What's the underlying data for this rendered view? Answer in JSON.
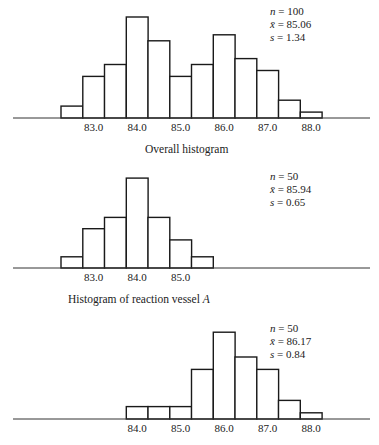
{
  "chart_data": [
    {
      "type": "bar",
      "title": "Overall histogram",
      "xlabel": "",
      "ylabel": "",
      "bin_width": 0.5,
      "bin_starts": [
        82.25,
        82.75,
        83.25,
        83.75,
        84.25,
        84.75,
        85.25,
        85.75,
        86.25,
        86.75,
        87.25,
        87.75
      ],
      "bin_centers": [
        82.5,
        83.0,
        83.5,
        84.0,
        84.5,
        85.0,
        85.5,
        86.0,
        86.5,
        87.0,
        87.5,
        88.0
      ],
      "values": [
        2,
        7,
        9,
        17,
        13,
        7,
        9,
        14,
        10,
        8,
        3,
        1
      ],
      "tick_labels": [
        "83.0",
        "84.0",
        "85.0",
        "86.0",
        "87.0",
        "88.0"
      ],
      "tick_values": [
        83.0,
        84.0,
        85.0,
        86.0,
        87.0,
        88.0
      ],
      "stats": {
        "n": "100",
        "mean": "85.06",
        "s": "1.34"
      },
      "grid": false
    },
    {
      "type": "bar",
      "title": "Histogram of reaction vessel A",
      "xlabel": "",
      "ylabel": "",
      "bin_width": 0.5,
      "bin_starts": [
        82.25,
        82.75,
        83.25,
        83.75,
        84.25,
        84.75,
        85.25
      ],
      "bin_centers": [
        82.5,
        83.0,
        83.5,
        84.0,
        84.5,
        85.0,
        85.5
      ],
      "values": [
        2,
        7,
        9,
        16,
        9,
        5,
        2
      ],
      "tick_labels": [
        "83.0",
        "84.0",
        "85.0"
      ],
      "tick_values": [
        83.0,
        84.0,
        85.0
      ],
      "stats": {
        "n": "50",
        "mean": "85.94",
        "s": "0.65"
      },
      "grid": false
    },
    {
      "type": "bar",
      "title": "",
      "xlabel": "",
      "ylabel": "",
      "bin_width": 0.5,
      "bin_starts": [
        83.75,
        84.25,
        84.75,
        85.25,
        85.75,
        86.25,
        86.75,
        87.25,
        87.75
      ],
      "bin_centers": [
        84.0,
        84.5,
        85.0,
        85.5,
        86.0,
        86.5,
        87.0,
        87.5,
        88.0
      ],
      "values": [
        2,
        2,
        2,
        8,
        14,
        10,
        8,
        3,
        1
      ],
      "tick_labels": [
        "84.0",
        "85.0",
        "86.0",
        "87.0",
        "88.0"
      ],
      "tick_values": [
        84.0,
        85.0,
        86.0,
        87.0,
        88.0
      ],
      "stats": {
        "n": "50",
        "mean": "86.17",
        "s": "0.84"
      },
      "grid": false
    }
  ],
  "panels": [
    {
      "caption": "Overall histogram",
      "stat_n_label": "n",
      "stat_mean_label": "x̄",
      "stat_s_label": "s",
      "n": "100",
      "mean": "85.06",
      "s": "1.34"
    },
    {
      "caption_prefix": "Histogram of reaction vessel ",
      "caption_var": "A",
      "stat_n_label": "n",
      "stat_mean_label": "x̄",
      "stat_s_label": "s",
      "n": "50",
      "mean": "85.94",
      "s": "0.65"
    },
    {
      "caption": "",
      "stat_n_label": "n",
      "stat_mean_label": "x̄",
      "stat_s_label": "s",
      "n": "50",
      "mean": "86.17",
      "s": "0.84"
    }
  ]
}
